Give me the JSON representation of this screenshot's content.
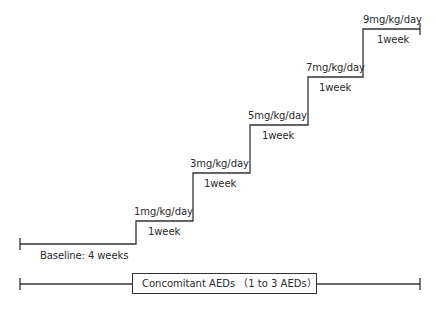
{
  "diagram": {
    "type": "dose-escalation-timeline",
    "baseline": {
      "label": "Baseline: 4 weeks"
    },
    "steps": [
      {
        "dose": "1mg/kg/day",
        "duration": "1week"
      },
      {
        "dose": "3mg/kg/day",
        "duration": "1week"
      },
      {
        "dose": "5mg/kg/day",
        "duration": "1week"
      },
      {
        "dose": "7mg/kg/day",
        "duration": "1week"
      },
      {
        "dose": "9mg/kg/day",
        "duration": "1week"
      }
    ],
    "concomitant": {
      "label": "Concomitant AEDs （1 to 3 AEDs）"
    },
    "colors": {
      "line": "#333333",
      "text": "#2a2a2a",
      "background": "#ffffff"
    }
  }
}
